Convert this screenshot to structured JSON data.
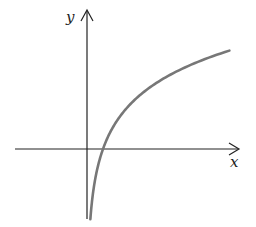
{
  "chart_data": {
    "type": "line",
    "title": "",
    "xlabel": "x",
    "ylabel": "y",
    "function": "y = ln(x)",
    "grid": false,
    "legend": null,
    "xlim": [
      -4.5,
      9.5
    ],
    "ylim": [
      -1.6,
      3.1
    ],
    "x_intercept": 1,
    "vertical_asymptote": 0,
    "series": [
      {
        "name": "ln(x)",
        "x": [
          0.21,
          0.3,
          0.5,
          0.75,
          1,
          1.5,
          2,
          3,
          4,
          5,
          6,
          7,
          8,
          8.9
        ],
        "y": [
          -1.56,
          -1.2,
          -0.69,
          -0.29,
          0,
          0.41,
          0.69,
          1.1,
          1.39,
          1.61,
          1.79,
          1.95,
          2.08,
          2.19
        ]
      }
    ],
    "colors": {
      "axes": "#222222",
      "curve": "#777777"
    }
  },
  "labels": {
    "x_axis": "x",
    "y_axis": "y"
  }
}
